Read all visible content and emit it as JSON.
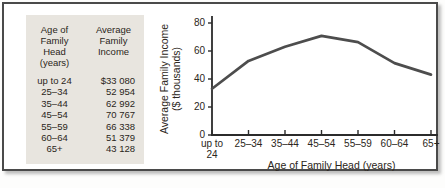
{
  "colors": {
    "frame_border": "#4a4a4a",
    "table_bg": "#e8e5df",
    "text": "#2b2620",
    "axis": "#2b2b2b",
    "line": "#4d4d4d"
  },
  "table": {
    "age_header": [
      "Age of",
      "Family",
      "Head",
      "(years)"
    ],
    "income_header": [
      "Average",
      "Family",
      "Income"
    ],
    "rows": [
      {
        "age": "up to 24",
        "income": "$33 080"
      },
      {
        "age": "25–34",
        "income": "52 954"
      },
      {
        "age": "35–44",
        "income": "62 992"
      },
      {
        "age": "45–54",
        "income": "70 767"
      },
      {
        "age": "55–59",
        "income": "66 338"
      },
      {
        "age": "60–64",
        "income": "51 379"
      },
      {
        "age": "65+",
        "income": "43 128"
      }
    ]
  },
  "chart_data": {
    "type": "line",
    "categories": [
      "up to 24",
      "25–34",
      "35–44",
      "45–54",
      "55–59",
      "60–64",
      "65+"
    ],
    "values": [
      33.08,
      52.954,
      62.992,
      70.767,
      66.338,
      51.379,
      43.128
    ],
    "values_unit": "$ thousands",
    "title": "",
    "xlabel": "Age of Family Head (years)",
    "ylabel": "Average Family Income ($ thousands)",
    "ylim": [
      0,
      80
    ],
    "yticks": [
      0,
      20,
      40,
      60,
      80
    ],
    "grid": false,
    "legend": "none"
  }
}
